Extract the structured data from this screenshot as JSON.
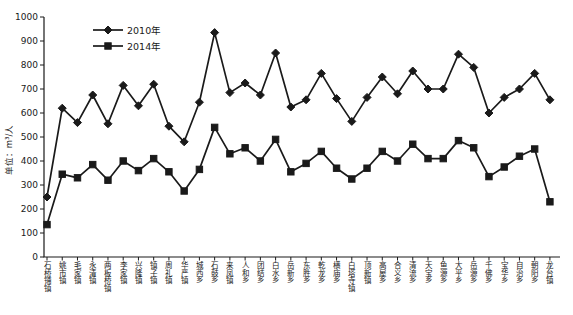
{
  "chart_data": {
    "type": "line",
    "title": "",
    "xlabel": "",
    "ylabel": "单位：m³/人",
    "ylim": [
      0,
      1000
    ],
    "yticks": [
      0,
      100,
      200,
      300,
      400,
      500,
      600,
      700,
      800,
      900,
      1000
    ],
    "grid": false,
    "legend_position": "top-left",
    "line_color": "#1a1a1a",
    "background": "#ffffff",
    "categories": [
      "石桥铺镇",
      "姚市镇",
      "毛家镇",
      "永清镇",
      "两板桥镇",
      "李家镇",
      "兴隆镇",
      "镇子镇",
      "周礼镇",
      "华严镇",
      "城西乡",
      "石鼓乡",
      "来凤镇",
      "人和乡",
      "团结乡",
      "白水乡",
      "岳新乡",
      "东胜乡",
      "乾龙乡",
      "横庙乡",
      "白塔寺镇",
      "顶新镇",
      "高屋乡",
      "合义乡",
      "清流乡",
      "天宝乡",
      "鱼源乡",
      "大平乡",
      "岳源乡",
      "千佛乡",
      "宝华乡",
      "自治乡",
      "朝阳乡",
      "龙台镇"
    ],
    "series": [
      {
        "name": "2010年",
        "marker": "diamond",
        "values": [
          250,
          620,
          560,
          675,
          555,
          715,
          630,
          720,
          545,
          480,
          645,
          935,
          685,
          725,
          675,
          850,
          625,
          655,
          765,
          660,
          565,
          665,
          750,
          680,
          775,
          700,
          700,
          845,
          790,
          600,
          665,
          700,
          765,
          655
        ]
      },
      {
        "name": "2014年",
        "marker": "square",
        "values": [
          135,
          345,
          330,
          385,
          320,
          400,
          360,
          410,
          355,
          275,
          365,
          540,
          430,
          455,
          400,
          490,
          355,
          390,
          440,
          370,
          325,
          370,
          440,
          400,
          470,
          410,
          410,
          485,
          455,
          335,
          375,
          420,
          450,
          230
        ]
      }
    ]
  }
}
